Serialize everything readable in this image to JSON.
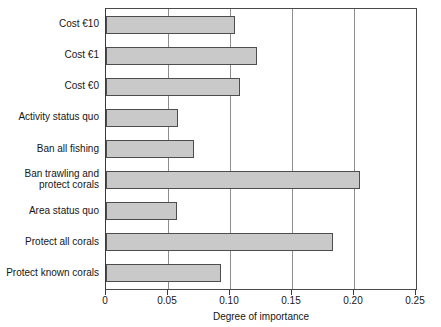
{
  "chart_data": {
    "type": "bar",
    "orientation": "horizontal",
    "title": "",
    "subtitle": "",
    "xlabel": "Degree of importance",
    "ylabel": "",
    "xlim": [
      0,
      0.25
    ],
    "grid": true,
    "legend": null,
    "xticks": [
      0,
      0.05,
      0.1,
      0.15,
      0.2,
      0.25
    ],
    "xticklabels": [
      "0",
      "0.05",
      "0.10",
      "0.15",
      "0.20",
      "0.25"
    ],
    "categories": [
      "Cost €10",
      "Cost €1",
      "Cost €0",
      "Activity status quo",
      "Ban all fishing",
      "Ban trawling and\nprotect corals",
      "Area status quo",
      "Protect all corals",
      "Protect known corals"
    ],
    "values": [
      0.104,
      0.122,
      0.108,
      0.058,
      0.071,
      0.205,
      0.057,
      0.183,
      0.093
    ],
    "bar_fill_color": "#c9c9c9",
    "bar_edge_color": "#4d4d4d",
    "axis_color": "#3a3a3a",
    "gridline_color": "#8d8d8d"
  }
}
